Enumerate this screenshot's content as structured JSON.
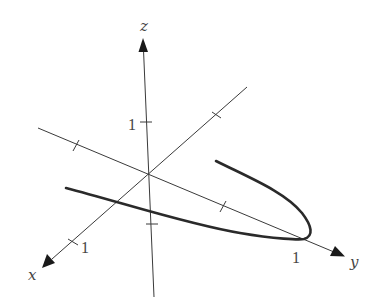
{
  "diagram": {
    "type": "3d-axes-space-curve",
    "colors": {
      "axis": "#3a3a3a",
      "curve": "#2a2a2a",
      "label": "#444444",
      "background": "#ffffff"
    },
    "axes": {
      "x": {
        "label": "x",
        "tick_label": "1"
      },
      "y": {
        "label": "y",
        "tick_label": "1"
      },
      "z": {
        "label": "z",
        "tick_label": "1"
      }
    },
    "curve": {
      "name": "space-curve",
      "shape": "parabola opening toward negative y, vertex near y = 1"
    }
  }
}
